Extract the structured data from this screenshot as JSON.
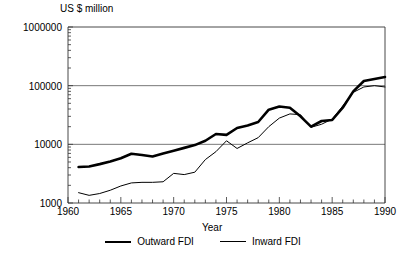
{
  "chart_data": {
    "type": "line",
    "title": "",
    "ylabel": "US $ million",
    "xlabel": "Year",
    "xlim": [
      1960,
      1990
    ],
    "ylim": [
      1000,
      1000000
    ],
    "yscale": "log",
    "grid": true,
    "grid_lines": [
      10000,
      100000
    ],
    "legend_position": "bottom",
    "ytick_labels": [
      "1000000",
      "100000",
      "10000",
      "1000"
    ],
    "ytick_values": [
      1000000,
      100000,
      10000,
      1000
    ],
    "xtick_labels": [
      "1960",
      "1965",
      "1970",
      "1975",
      "1980",
      "1985",
      "1990"
    ],
    "xtick_values": [
      1960,
      1965,
      1970,
      1975,
      1980,
      1985,
      1990
    ],
    "x": [
      1961,
      1962,
      1963,
      1964,
      1965,
      1966,
      1967,
      1968,
      1969,
      1970,
      1971,
      1972,
      1973,
      1974,
      1975,
      1976,
      1977,
      1978,
      1979,
      1980,
      1981,
      1982,
      1983,
      1984,
      1985,
      1986,
      1987,
      1988,
      1989,
      1990
    ],
    "series": [
      {
        "name": "Outward FDI",
        "style": "thick",
        "color": "#000000",
        "values": [
          4100,
          4200,
          4600,
          5100,
          5800,
          6900,
          6600,
          6200,
          7000,
          7800,
          8700,
          9700,
          11500,
          15000,
          14500,
          19000,
          21000,
          24000,
          39000,
          44000,
          42000,
          30000,
          20000,
          25000,
          26000,
          42000,
          80000,
          120000,
          130000,
          140000
        ]
      },
      {
        "name": "Inward FDI",
        "style": "thin",
        "color": "#000000",
        "values": [
          1500,
          1350,
          1450,
          1650,
          1950,
          2200,
          2250,
          2250,
          2300,
          3200,
          3050,
          3350,
          5500,
          7500,
          11500,
          8500,
          10600,
          13000,
          20000,
          28000,
          33000,
          32000,
          19500,
          22000,
          27000,
          45000,
          77000,
          95000,
          100000,
          95000
        ]
      }
    ]
  },
  "legend": {
    "entries": [
      {
        "label": "Outward FDI"
      },
      {
        "label": "Inward FDI"
      }
    ]
  }
}
